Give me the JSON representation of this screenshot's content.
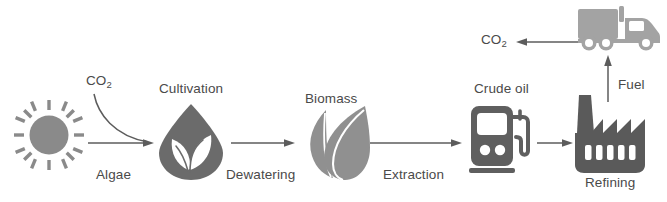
{
  "diagram": {
    "colors": {
      "sun": "#8a8a8a",
      "cultivation": "#6b6b6b",
      "biomass": "#909090",
      "crude_oil": "#5f5f5f",
      "refining": "#5a5a5a",
      "truck": "#a3a3a3",
      "arrow": "#5c5c5c",
      "text": "#4a4a4a",
      "background": "#ffffff"
    },
    "icons": [
      {
        "name": "sun-icon",
        "label": ""
      },
      {
        "name": "droplet-leaf-icon",
        "label": "Cultivation"
      },
      {
        "name": "double-leaf-icon",
        "label": "Biomass"
      },
      {
        "name": "fuel-pump-icon",
        "label": "Crude oil"
      },
      {
        "name": "factory-icon",
        "label": "Refining"
      },
      {
        "name": "truck-icon",
        "label": ""
      }
    ],
    "labels": {
      "co2_input": "CO",
      "co2_input_sub": "2",
      "algae": "Algae",
      "cultivation": "Cultivation",
      "dewatering": "Dewatering",
      "biomass": "Biomass",
      "extraction": "Extraction",
      "crude_oil": "Crude oil",
      "refining": "Refining",
      "fuel": "Fuel",
      "co2_output": "CO",
      "co2_output_sub": "2"
    },
    "arrows": [
      {
        "name": "arrow-sun-to-cultivation",
        "direction": "right"
      },
      {
        "name": "arrow-co2-curve",
        "direction": "curve-down-right"
      },
      {
        "name": "arrow-dewatering",
        "direction": "right"
      },
      {
        "name": "arrow-extraction",
        "direction": "right"
      },
      {
        "name": "arrow-crude-to-refining",
        "direction": "right"
      },
      {
        "name": "arrow-fuel-up",
        "direction": "up"
      },
      {
        "name": "arrow-co2-emission",
        "direction": "left"
      }
    ]
  }
}
